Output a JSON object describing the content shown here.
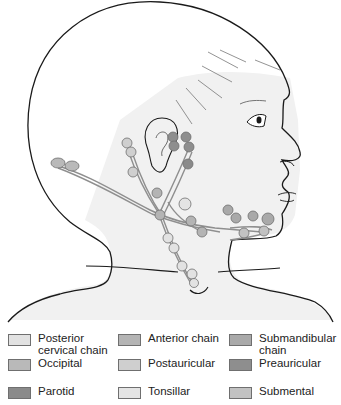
{
  "figure": {
    "colors": {
      "outline": "#1a1a1a",
      "skin_fill": "#f1f1f1",
      "vessel": "#9a9a9a"
    }
  },
  "legend": {
    "items": [
      {
        "label": "Posterior\ncervical chain",
        "color": "#e2e2e2"
      },
      {
        "label": "Anterior chain",
        "color": "#b4b4b4"
      },
      {
        "label": "Submandibular\nchain",
        "color": "#a9a9a9"
      },
      {
        "label": "Occipital",
        "color": "#b9b9b9"
      },
      {
        "label": "Postauricular",
        "color": "#cfcfcf"
      },
      {
        "label": "Preauricular",
        "color": "#8e8e8e"
      },
      {
        "label": "Parotid",
        "color": "#8a8a8a"
      },
      {
        "label": "Tonsillar",
        "color": "#e4e4e4"
      },
      {
        "label": "Submental",
        "color": "#c2c2c2"
      }
    ]
  }
}
